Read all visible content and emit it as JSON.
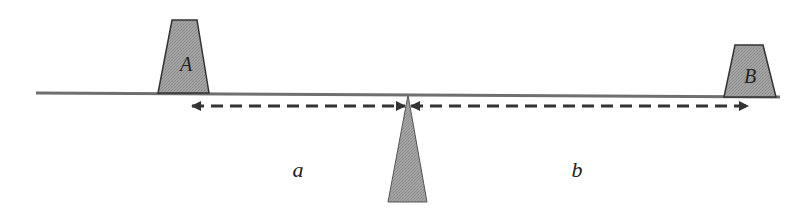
{
  "diagram": {
    "title": "",
    "colors": {
      "block_fill": "#9a9a9a",
      "block_stroke": "#333333",
      "beam": "#6f6f6f",
      "fulcrum_fill": "#9a9a9a",
      "arrow": "#333333",
      "background": "#ffffff"
    },
    "beam": {
      "x1": 36,
      "y1": 93,
      "x2": 780,
      "y2": 97
    },
    "fulcrum": {
      "apex": [
        408,
        95
      ],
      "base_left": [
        388,
        202
      ],
      "base_right": [
        427,
        202
      ]
    },
    "blocks": [
      {
        "id": "A",
        "label": "A",
        "top_left": [
          172,
          20
        ],
        "top_right": [
          197,
          20
        ],
        "bottom_left": [
          158,
          93
        ],
        "bottom_right": [
          209,
          93
        ],
        "label_pos": [
          186,
          64
        ]
      },
      {
        "id": "B",
        "label": "B",
        "top_left": [
          735,
          45
        ],
        "top_right": [
          763,
          45
        ],
        "bottom_left": [
          724,
          97
        ],
        "bottom_right": [
          776,
          97
        ],
        "label_pos": [
          750,
          76
        ]
      }
    ],
    "dimensions": [
      {
        "id": "a",
        "label": "a",
        "from_x": 192,
        "to_x": 405,
        "y": 106,
        "label_pos": [
          298,
          170
        ]
      },
      {
        "id": "b",
        "label": "b",
        "from_x": 411,
        "to_x": 748,
        "y": 106,
        "label_pos": [
          577,
          170
        ]
      }
    ]
  }
}
